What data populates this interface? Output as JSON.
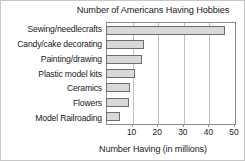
{
  "chart_data": {
    "type": "bar",
    "orientation": "horizontal",
    "title": "Number of Americans Having Hobbies",
    "xlabel": "Number Having (in millions)",
    "ylabel": "",
    "categories": [
      "Sewing/needlecrafts",
      "Candy/cake decorating",
      "Painting/drawing",
      "Plastic model kits",
      "Ceramics",
      "Flowers",
      "Model Railroading"
    ],
    "values": [
      46,
      14.5,
      13.5,
      11,
      9,
      8.5,
      5
    ],
    "xlim": [
      0,
      50
    ],
    "xticks": [
      10,
      20,
      30,
      40,
      50
    ],
    "xtick_labels": [
      "10",
      "20",
      "30",
      "40",
      "50"
    ],
    "grid": "vertical",
    "legend": "none",
    "bar_fill_color": "#d9d9d9",
    "bar_border_color": "#6e6e6e",
    "gridline_color": "#c0c0c0",
    "axis_color": "#8c8c8c",
    "text_color": "#1a1a1a"
  }
}
